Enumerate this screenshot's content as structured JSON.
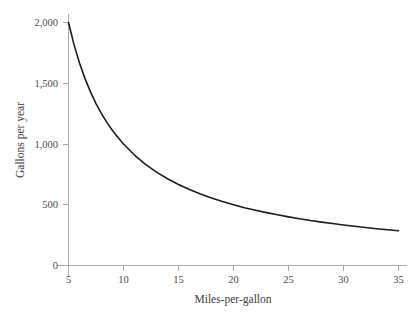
{
  "figure": {
    "background_color": "#ffffff",
    "axis_color": "#a9a9a9",
    "curve_color": "#1c1c1c",
    "label_color": "#4a4a4a"
  },
  "chart_data": {
    "type": "line",
    "title": "",
    "subtitle": "",
    "xlabel": "Miles-per-gallon",
    "ylabel": "Gallons per year",
    "xlim": [
      5,
      35
    ],
    "ylim": [
      0,
      2000
    ],
    "xticks": [
      5,
      10,
      15,
      20,
      25,
      30,
      35
    ],
    "xtick_labels": [
      "5",
      "10",
      "15",
      "20",
      "25",
      "30",
      "35"
    ],
    "yticks": [
      0,
      500,
      1000,
      1500,
      2000
    ],
    "ytick_labels": [
      "0",
      "500",
      "1,000",
      "1,500",
      "2,000"
    ],
    "grid": false,
    "legend": null,
    "legend_position": "none",
    "annotations": [],
    "relationship": "y = 10000 / x  (gallons per year for 10,000 miles driven annually)",
    "series": [
      {
        "name": "Gallons per year",
        "x": [
          5,
          5.5,
          6,
          6.5,
          7,
          7.5,
          8,
          8.5,
          9,
          9.5,
          10,
          11,
          12,
          13,
          14,
          15,
          16,
          17,
          18,
          19,
          20,
          21,
          22,
          23,
          24,
          25,
          26,
          27,
          28,
          29,
          30,
          31,
          32,
          33,
          34,
          35
        ],
        "y": [
          2000,
          1818,
          1667,
          1538,
          1429,
          1333,
          1250,
          1176,
          1111,
          1053,
          1000,
          909,
          833,
          769,
          714,
          667,
          625,
          588,
          556,
          526,
          500,
          476,
          455,
          435,
          417,
          400,
          385,
          370,
          357,
          345,
          333,
          323,
          313,
          303,
          294,
          286
        ]
      }
    ]
  }
}
